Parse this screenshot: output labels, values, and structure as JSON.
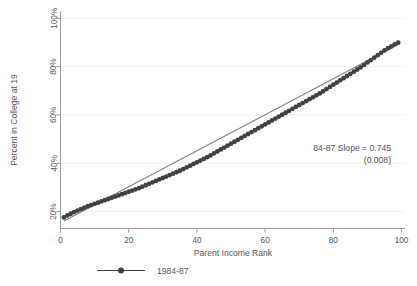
{
  "chart_data": {
    "type": "scatter",
    "title": "",
    "xlabel": "Parent Income Rank",
    "ylabel": "Percent in College at 19",
    "xlim": [
      0,
      101
    ],
    "ylim": [
      13,
      103
    ],
    "grid": true,
    "xticks": [
      0,
      20,
      40,
      60,
      80,
      100
    ],
    "xticklabels": [
      "0",
      "20",
      "40",
      "60",
      "80",
      "100"
    ],
    "yticks": [
      20,
      40,
      60,
      80,
      100
    ],
    "yticklabels": [
      "20%",
      "40%",
      "60%",
      "80%",
      "100%"
    ],
    "legend": {
      "position": "below-axes-left",
      "entries": [
        {
          "name": "1984-87",
          "marker": "circle",
          "line": "solid",
          "color": "#3f3f44"
        }
      ]
    },
    "annotations": [
      {
        "text": "84-87 Slope = 0.745",
        "x": 72,
        "y": 46
      },
      {
        "text": "(0.008)",
        "x": 86,
        "y": 41
      }
    ],
    "series": [
      {
        "name": "1984-87",
        "marker": "circle",
        "color": "#3f3f44",
        "x": [
          1,
          2,
          3,
          4,
          5,
          6,
          7,
          8,
          9,
          10,
          11,
          12,
          13,
          14,
          15,
          16,
          17,
          18,
          19,
          20,
          21,
          22,
          23,
          24,
          25,
          26,
          27,
          28,
          29,
          30,
          31,
          32,
          33,
          34,
          35,
          36,
          37,
          38,
          39,
          40,
          41,
          42,
          43,
          44,
          45,
          46,
          47,
          48,
          49,
          50,
          51,
          52,
          53,
          54,
          55,
          56,
          57,
          58,
          59,
          60,
          61,
          62,
          63,
          64,
          65,
          66,
          67,
          68,
          69,
          70,
          71,
          72,
          73,
          74,
          75,
          76,
          77,
          78,
          79,
          80,
          81,
          82,
          83,
          84,
          85,
          86,
          87,
          88,
          89,
          90,
          91,
          92,
          93,
          94,
          95,
          96,
          97,
          98,
          99
        ],
        "y": [
          17.6,
          18.4,
          19.1,
          19.8,
          20.4,
          21.0,
          21.6,
          22.2,
          22.7,
          23.2,
          23.7,
          24.2,
          24.7,
          25.2,
          25.7,
          26.2,
          26.7,
          27.2,
          27.7,
          28.2,
          28.7,
          29.2,
          29.7,
          30.3,
          30.9,
          31.5,
          32.1,
          32.7,
          33.3,
          33.9,
          34.5,
          35.1,
          35.7,
          36.3,
          36.9,
          37.6,
          38.3,
          39.0,
          39.7,
          40.4,
          41.1,
          41.8,
          42.5,
          43.3,
          44.1,
          44.9,
          45.7,
          46.5,
          47.3,
          48.1,
          48.9,
          49.7,
          50.5,
          51.3,
          52.1,
          52.9,
          53.7,
          54.5,
          55.3,
          56.1,
          56.9,
          57.7,
          58.5,
          59.3,
          60.1,
          60.9,
          61.7,
          62.5,
          63.3,
          64.1,
          64.9,
          65.7,
          66.5,
          67.3,
          68.1,
          68.9,
          69.8,
          70.7,
          71.6,
          72.5,
          73.4,
          74.3,
          75.2,
          76.1,
          77.0,
          77.9,
          78.8,
          79.7,
          80.7,
          81.7,
          82.7,
          83.7,
          84.7,
          85.7,
          86.7,
          87.6,
          88.4,
          89.2,
          89.9
        ]
      }
    ],
    "fit_line": {
      "name": "84-87 fit",
      "slope": 0.745,
      "slope_se": 0.008,
      "intercept": 15.4,
      "color": "#808085",
      "x_start": 1,
      "x_end": 99
    }
  },
  "axes": {
    "x_title": "Parent Income Rank",
    "y_title": "Percent in College at 19"
  },
  "annotation": {
    "slope_line": "84-87 Slope = 0.745",
    "se_line": "(0.008)"
  },
  "legend": {
    "entry_label": "1984-87"
  }
}
